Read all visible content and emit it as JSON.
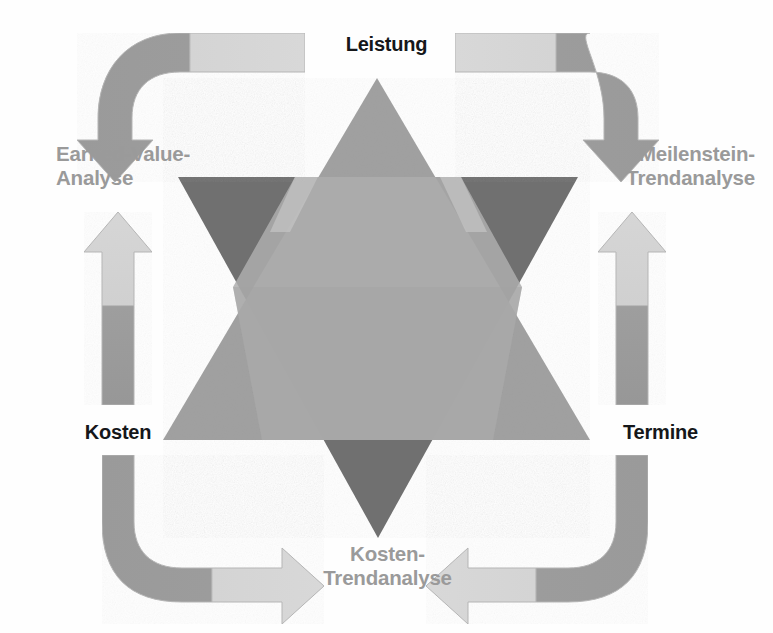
{
  "diagram": {
    "type": "star-of-david / overlapping-triangles cycle diagram",
    "background_color": "#ffffff",
    "corner_label_color": "#15171a",
    "method_label_color": "#9a9a9a",
    "corners": [
      {
        "id": "leistung",
        "label": "Leistung",
        "position": "top"
      },
      {
        "id": "kosten",
        "label": "Kosten",
        "position": "bottom-left"
      },
      {
        "id": "termine",
        "label": "Termine",
        "position": "bottom-right"
      }
    ],
    "methods": [
      {
        "id": "earned-value-analyse",
        "label": "Earned-Value-\nAnalyse",
        "position": "left"
      },
      {
        "id": "meilenstein-trendanalyse",
        "label": "Meilenstein-\nTrendanalyse",
        "position": "right"
      },
      {
        "id": "kosten-trendanalyse",
        "label": "Kosten-\nTrendanalyse",
        "position": "bottom"
      }
    ],
    "arrows": [
      {
        "id": "arrow-top-left",
        "name": "leistung-to-earned-value-arrow",
        "direction": "down",
        "shape": "elbow"
      },
      {
        "id": "arrow-top-right",
        "name": "leistung-to-meilenstein-arrow",
        "direction": "down",
        "shape": "elbow"
      },
      {
        "id": "arrow-left",
        "name": "earned-value-to-kosten-arrow",
        "direction": "up",
        "shape": "straight"
      },
      {
        "id": "arrow-right",
        "name": "meilenstein-to-termine-arrow",
        "direction": "up",
        "shape": "straight"
      },
      {
        "id": "arrow-bottom-left",
        "name": "kosten-to-kosten-trendanalyse-arrow",
        "direction": "right",
        "shape": "elbow"
      },
      {
        "id": "arrow-bottom-right",
        "name": "termine-to-kosten-trendanalyse-arrow",
        "direction": "left",
        "shape": "elbow"
      }
    ],
    "shapes": {
      "up_triangle": {
        "name": "upward-triangle",
        "fill": "#9d9d9d"
      },
      "down_triangle": {
        "name": "downward-triangle",
        "fill": "#6f6f6f"
      },
      "overlap_fill": "#b4b4b4",
      "arrow_dark": "#9a9a9a",
      "arrow_light": "#d2d2d2"
    }
  }
}
